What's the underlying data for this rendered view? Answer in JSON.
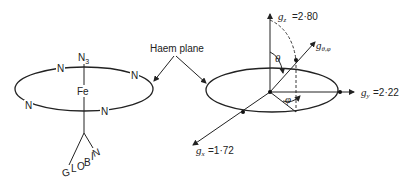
{
  "left_diagram": {
    "ligand_top": "N",
    "ligand_top_sub": "3",
    "center_atom": "Fe",
    "ring_atoms": [
      "N",
      "N",
      "N",
      "N"
    ],
    "protein_label": [
      "G",
      "L",
      "O",
      "B",
      "I",
      "N"
    ]
  },
  "callout": {
    "label": "Haem plane"
  },
  "right_diagram": {
    "gz_label": "g",
    "gz_sub": "z",
    "gz_value": "=2·80",
    "gy_label": "g",
    "gy_sub": "y",
    "gy_value": "=2·22",
    "gx_label": "g",
    "gx_sub": "x",
    "gx_value": "=1·72",
    "g_theta_phi_label": "g",
    "g_theta_phi_sub": "θ,φ",
    "theta_symbol": "θ",
    "phi_symbol": "φ"
  }
}
